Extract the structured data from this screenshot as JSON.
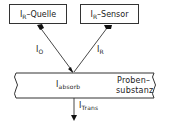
{
  "diagram": {
    "source_box": {
      "main": "I",
      "sub": "R",
      "suffix": "–Quelle"
    },
    "sensor_box": {
      "main": "I",
      "sub": "R",
      "suffix": "–Sensor"
    },
    "incident_label": {
      "main": "I",
      "sub": "O"
    },
    "reflected_label": {
      "main": "I",
      "sub": "R"
    },
    "absorbed_label": {
      "main": "I",
      "sub": "absorb"
    },
    "sample_label_line1": "Proben–",
    "sample_label_line2": "substanz",
    "transmitted_label": {
      "main": "I",
      "sub": "Trans"
    }
  }
}
